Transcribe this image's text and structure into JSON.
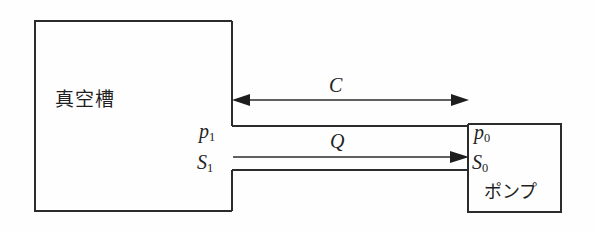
{
  "diagram": {
    "title": "",
    "stroke_color": "#2b2b2b",
    "background_color": "#fefefe",
    "chamber": {
      "label": "真空槽",
      "pressure_label": "p",
      "pressure_subscript": "1",
      "pumping_speed_label": "S",
      "pumping_speed_subscript": "1"
    },
    "pump": {
      "label": "ポンプ",
      "pressure_label": "p",
      "pressure_subscript": "0",
      "pumping_speed_label": "S",
      "pumping_speed_subscript": "0"
    },
    "conductance_arrow": {
      "label": "C",
      "direction": "double"
    },
    "throughput_arrow": {
      "label": "Q",
      "direction": "right"
    }
  }
}
